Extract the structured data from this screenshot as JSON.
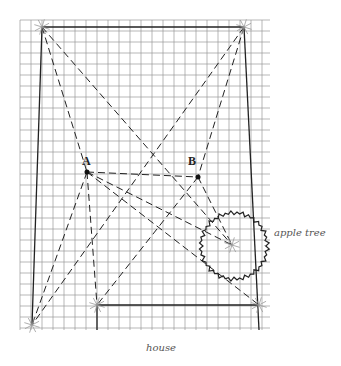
{
  "diagram": {
    "grid": {
      "x0": 20,
      "y0": 20,
      "x1": 270,
      "y1": 330,
      "cell": 11,
      "color": "#9a9a9a"
    },
    "points": {
      "top_left": {
        "x": 42,
        "y": 27
      },
      "top_right": {
        "x": 244,
        "y": 27
      },
      "bottom_left": {
        "x": 32,
        "y": 325
      },
      "house_left": {
        "x": 97,
        "y": 305
      },
      "house_right": {
        "x": 259,
        "y": 305
      },
      "A": {
        "x": 87,
        "y": 172,
        "label": "A"
      },
      "B": {
        "x": 198,
        "y": 177,
        "label": "B"
      },
      "tree_point": {
        "x": 232,
        "y": 245
      }
    },
    "tree": {
      "cx": 234,
      "cy": 246,
      "r": 33
    },
    "labels": {
      "apple_tree": "apple tree",
      "house": "house",
      "A": "A",
      "B": "B"
    }
  }
}
